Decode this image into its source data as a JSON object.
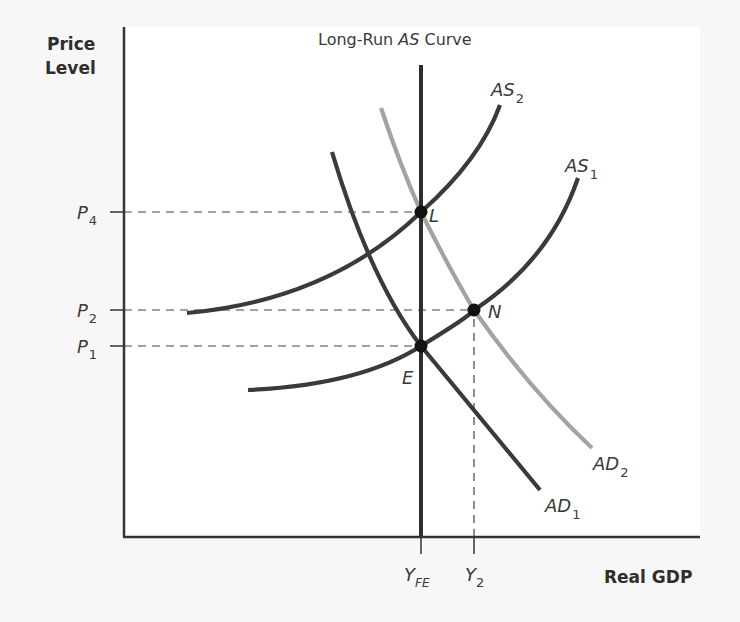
{
  "chart_data": {
    "type": "line",
    "title": "Long-Run AS Curve",
    "title_parts": {
      "pre": "Long-Run ",
      "ital": "AS",
      "post": " Curve"
    },
    "xlabel": "Real GDP",
    "ylabel_lines": [
      "Price",
      "Level"
    ],
    "grid": false,
    "legend": "none (curves labeled inline)",
    "y_ticks": [
      {
        "main": "P",
        "sub": "4",
        "y": 212
      },
      {
        "main": "P",
        "sub": "2",
        "y": 310
      },
      {
        "main": "P",
        "sub": "1",
        "y": 346
      }
    ],
    "x_ticks": [
      {
        "main": "Y",
        "sub": "FE",
        "x": 421
      },
      {
        "main": "Y",
        "sub": "2",
        "x": 474
      }
    ],
    "series": [
      {
        "name": "Long-Run AS",
        "kind": "vertical",
        "color": "#2e2e2e",
        "x": 421,
        "y_top": 65,
        "y_bottom": 537
      },
      {
        "name": "AS1",
        "label_main": "AS",
        "label_sub": "1",
        "color": "#3a3a3a",
        "path": "M248,390 Q360,385 421,346 Q470,316 474,310 Q550,260 578,178",
        "label_pos": [
          565,
          172
        ]
      },
      {
        "name": "AS2",
        "label_main": "AS",
        "label_sub": "2",
        "color": "#3a3a3a",
        "path": "M187,313 Q330,300 421,212 Q480,160 500,105",
        "label_pos": [
          491,
          96
        ]
      },
      {
        "name": "AD1",
        "label_main": "AD",
        "label_sub": "1",
        "color": "#3a3a3a",
        "path": "M332,152 Q370,280 421,346 Q490,430 540,490",
        "label_pos": [
          545,
          512
        ]
      },
      {
        "name": "AD2",
        "label_main": "AD",
        "label_sub": "2",
        "color": "#a3a3a3",
        "path": "M381,108 Q400,165 421,212 Q450,270 474,310 Q530,390 592,448",
        "label_pos": [
          593,
          470
        ]
      }
    ],
    "points": [
      {
        "name": "L",
        "x": 421,
        "y": 212,
        "label_dx": 8,
        "label_dy": 10
      },
      {
        "name": "N",
        "x": 474,
        "y": 310,
        "label_dx": 14,
        "label_dy": 8
      },
      {
        "name": "E",
        "x": 421,
        "y": 346,
        "label_dx": -19,
        "label_dy": 38
      }
    ],
    "axes": {
      "origin": [
        124,
        537
      ],
      "y_top": 27,
      "x_right": 700
    }
  }
}
